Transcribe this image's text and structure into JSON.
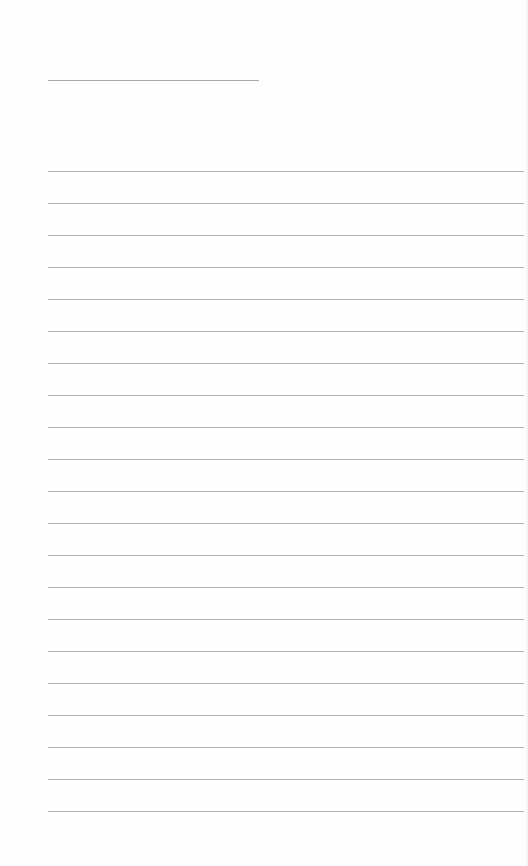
{
  "document": {
    "type": "lined-paper",
    "title_line": {
      "x": 48,
      "y": 80,
      "width": 211,
      "text": ""
    },
    "ruled_lines": {
      "count": 21,
      "start_y": 171,
      "spacing": 32,
      "x": 48,
      "width": 476,
      "entries": [
        "",
        "",
        "",
        "",
        "",
        "",
        "",
        "",
        "",
        "",
        "",
        "",
        "",
        "",
        "",
        "",
        "",
        "",
        "",
        "",
        ""
      ]
    },
    "colors": {
      "paper": "#fefefe",
      "line": "#b3b3b3",
      "title_line": "#a9a9a9"
    }
  }
}
